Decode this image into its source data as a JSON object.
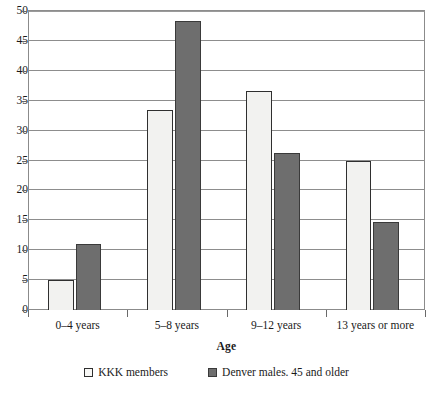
{
  "chart_data": {
    "type": "bar",
    "title": "",
    "xlabel": "Age",
    "ylabel": "",
    "categories": [
      "0–4 years",
      "5–8 years",
      "9–12 years",
      "13 years or more"
    ],
    "series": [
      {
        "name": "KKK members",
        "values": [
          5,
          33.5,
          36.7,
          25
        ],
        "color": "#f2f2f0"
      },
      {
        "name": "Denver males. 45 and older",
        "values": [
          11.1,
          48.3,
          26.2,
          14.7
        ],
        "color": "#6e6e6e"
      }
    ],
    "ylim": [
      0,
      50
    ],
    "ytick_labels": [
      "0",
      "5",
      "10",
      "15",
      "20",
      "25",
      "30",
      "35",
      "40",
      "45",
      "50"
    ],
    "ytick_values": [
      0,
      5,
      10,
      15,
      20,
      25,
      30,
      35,
      40,
      45,
      50
    ],
    "grid": true,
    "legend_position": "bottom"
  },
  "legend": {
    "items": [
      {
        "label": "KKK members",
        "swatch": "light-square-swatch"
      },
      {
        "label": "Denver males. 45 and older",
        "swatch": "dark-square-swatch"
      }
    ]
  },
  "axis": {
    "x_title": "Age"
  },
  "colors": {
    "series_light": "#f2f2f0",
    "series_dark": "#6e6e6e",
    "grid": "#8d8d8d",
    "frame": "#8b8b8b",
    "text": "#1a1a1a"
  }
}
